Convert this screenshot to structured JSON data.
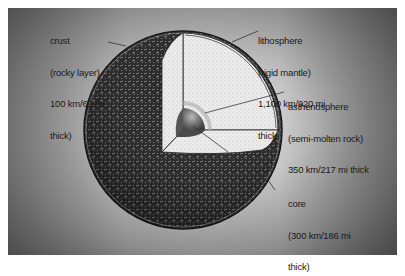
{
  "diagram": {
    "labels": {
      "crust": [
        "crust",
        "(rocky layer)",
        "100 km/62 mi",
        "thick)"
      ],
      "lithosphere": [
        "lithosphere",
        "(rigid mantle)",
        "1,100 km/920 mi",
        "thick"
      ],
      "asthenosphere": [
        "asthenosphere",
        "(semi-molten rock)",
        "350 km/217 mi thick"
      ],
      "core": [
        "core",
        "(300 km/186 mi",
        "thick)"
      ]
    },
    "colors": {
      "surface_dark": "#1e1e1e",
      "mantle_light": "#e8e8e8",
      "core_gray": "#6a6a6a",
      "text": "#1a1a1a"
    }
  }
}
